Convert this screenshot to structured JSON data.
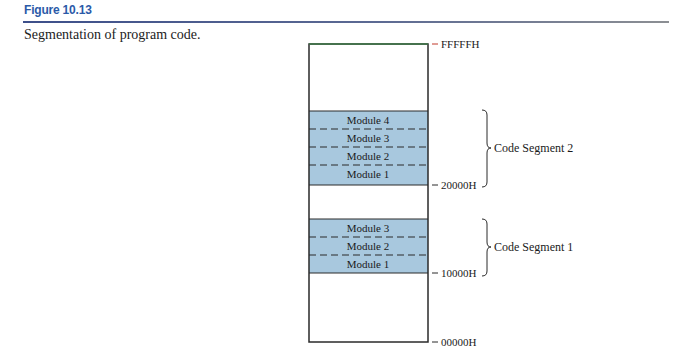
{
  "figure": {
    "label": "Figure 10.13",
    "caption": "Segmentation of program code."
  },
  "colors": {
    "label": "#2b5aa8",
    "module_fill": "#a8c8de",
    "outline": "#2a2a2a"
  },
  "memory": {
    "top_address": "FFFFFH",
    "bottom_address": "00000H",
    "segments": [
      {
        "name": "Code Segment 2",
        "base_address": "20000H",
        "modules": [
          "Module 4",
          "Module 3",
          "Module 2",
          "Module 1"
        ]
      },
      {
        "name": "Code Segment 1",
        "base_address": "10000H",
        "modules": [
          "Module 3",
          "Module 2",
          "Module 1"
        ]
      }
    ]
  }
}
